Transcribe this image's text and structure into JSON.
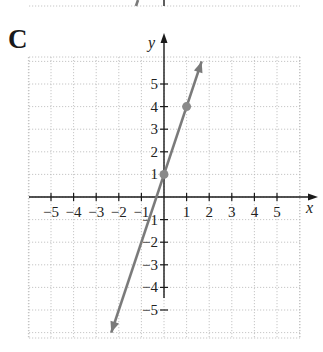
{
  "panel_label": "C",
  "chart_data": {
    "type": "line",
    "title": "",
    "xlabel": "x",
    "ylabel": "y",
    "xlim": [
      -6,
      6
    ],
    "ylim": [
      -6,
      6
    ],
    "grid": true,
    "x_ticks": [
      -5,
      -4,
      -3,
      -2,
      -1,
      1,
      2,
      3,
      4,
      5
    ],
    "y_ticks": [
      5,
      4,
      3,
      2,
      1,
      -1,
      -2,
      -3,
      -4,
      -5
    ],
    "x_tick_labels": [
      "−5",
      "−4",
      "−3",
      "−2",
      "−1",
      "1",
      "2",
      "3",
      "4",
      "5"
    ],
    "y_tick_labels": [
      "5",
      "4",
      "3",
      "2",
      "1",
      "−1",
      "−2",
      "−3",
      "−4",
      "−5"
    ],
    "series": [
      {
        "name": "y = 3x + 1",
        "equation": "y = 3x + 1",
        "slope": 3,
        "intercept": 1,
        "points": [
          {
            "x": 0,
            "y": 1
          },
          {
            "x": 1,
            "y": 4
          }
        ],
        "color": "#7a7a7a",
        "arrows": "both"
      }
    ]
  }
}
